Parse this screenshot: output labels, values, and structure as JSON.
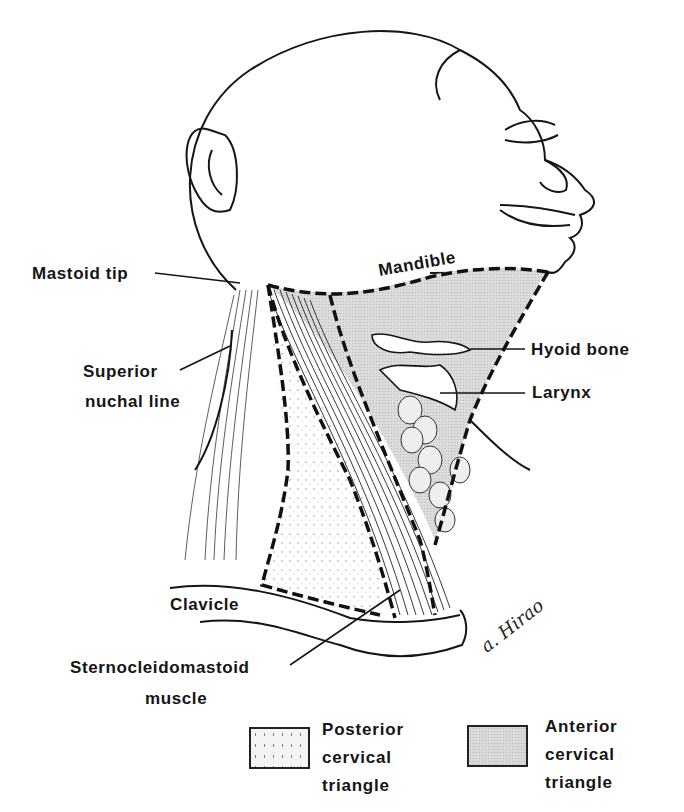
{
  "figure": {
    "labels": {
      "mastoid_tip": "Mastoid tip",
      "mandible": "Mandible",
      "superior_nuchal_line_1": "Superior",
      "superior_nuchal_line_2": "nuchal line",
      "hyoid_bone": "Hyoid bone",
      "larynx": "Larynx",
      "clavicle": "Clavicle",
      "scm_1": "Sternocleidomastoid",
      "scm_2": "muscle"
    },
    "signature": "a. Hirao"
  },
  "legend": {
    "items": [
      {
        "lines": [
          "Posterior",
          "cervical",
          "triangle"
        ],
        "pattern": "sparse-stipple",
        "color": "#f4f4f4"
      },
      {
        "lines": [
          "Anterior",
          "cervical",
          "triangle"
        ],
        "pattern": "dense-stipple",
        "color": "#d9d9d9"
      }
    ]
  },
  "colors": {
    "ink": "#151515",
    "anterior_fill": "#d9d9d9",
    "posterior_fill": "#f4f4f4",
    "background": "#ffffff"
  }
}
